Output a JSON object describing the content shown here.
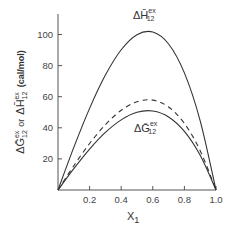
{
  "chart_data": {
    "type": "line",
    "title": "",
    "xlabel": "X1",
    "ylabel": "ΔḠ12ex or ΔH̄12ex (cal/mol)",
    "xlim": [
      0,
      1.0
    ],
    "ylim": [
      0,
      110
    ],
    "grid": false,
    "legend": "none (curves labeled directly)",
    "x_ticks": [
      "0.2",
      "0.4",
      "0.6",
      "0.8",
      "1.0"
    ],
    "y_ticks": [
      "20",
      "40",
      "60",
      "80",
      "100"
    ],
    "x": [
      0,
      0.1,
      0.2,
      0.3,
      0.4,
      0.5,
      0.6,
      0.7,
      0.8,
      0.9,
      1.0
    ],
    "series": [
      {
        "name": "ΔH̄12ex",
        "style": "solid",
        "values": [
          0,
          27.4,
          52.5,
          73.9,
          90.2,
          99.9,
          101.6,
          93.9,
          75.3,
          44.5,
          0
        ]
      },
      {
        "name": "dashed (unlabeled)",
        "style": "dashed",
        "values": [
          0,
          15.6,
          29.9,
          42.0,
          51.3,
          56.8,
          57.8,
          53.4,
          42.8,
          25.3,
          0
        ]
      },
      {
        "name": "ΔḠ12ex",
        "style": "solid",
        "values": [
          0,
          13.7,
          26.3,
          37.0,
          45.1,
          50.0,
          50.8,
          47.0,
          37.7,
          22.3,
          0
        ]
      }
    ],
    "annotations": [
      {
        "text": "ΔH̄12ex",
        "near": "top of upper solid curve"
      },
      {
        "text": "ΔḠ12ex",
        "near": "below peak of lower solid curve"
      }
    ]
  },
  "labels": {
    "x_axis_main": "X",
    "x_axis_sub": "1",
    "y_axis_g": "ΔḠ",
    "y_axis_sub": "12",
    "y_axis_sup": "ex",
    "y_axis_or": "or",
    "y_axis_h": "ΔH̄",
    "y_axis_units": "(cal/mol)",
    "h_label_main": "ΔH̄",
    "h_label_sub": "12",
    "h_label_sup": "ex",
    "g_label_main": "ΔḠ",
    "g_label_sub": "12",
    "g_label_sup": "ex"
  }
}
